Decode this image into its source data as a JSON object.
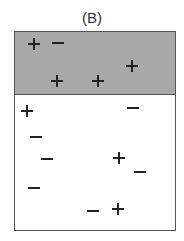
{
  "figure": {
    "title": "(B)",
    "region_colors": {
      "shaded": "#a9a9a9",
      "unshaded": "#ffffff"
    },
    "symbols": [
      {
        "type": "plus",
        "region": "shaded",
        "x": 34,
        "y": 44
      },
      {
        "type": "minus",
        "region": "shaded",
        "x": 58,
        "y": 43
      },
      {
        "type": "plus",
        "region": "shaded",
        "x": 132,
        "y": 66
      },
      {
        "type": "plus",
        "region": "shaded",
        "x": 57,
        "y": 81
      },
      {
        "type": "plus",
        "region": "shaded",
        "x": 98,
        "y": 81
      },
      {
        "type": "plus",
        "region": "unshaded",
        "x": 27,
        "y": 111
      },
      {
        "type": "minus",
        "region": "unshaded",
        "x": 133,
        "y": 108
      },
      {
        "type": "minus",
        "region": "unshaded",
        "x": 36,
        "y": 137
      },
      {
        "type": "minus",
        "region": "unshaded",
        "x": 47,
        "y": 159
      },
      {
        "type": "plus",
        "region": "unshaded",
        "x": 119,
        "y": 158
      },
      {
        "type": "minus",
        "region": "unshaded",
        "x": 140,
        "y": 172
      },
      {
        "type": "minus",
        "region": "unshaded",
        "x": 34,
        "y": 188
      },
      {
        "type": "minus",
        "region": "unshaded",
        "x": 93,
        "y": 211
      },
      {
        "type": "plus",
        "region": "unshaded",
        "x": 118,
        "y": 209
      }
    ]
  }
}
